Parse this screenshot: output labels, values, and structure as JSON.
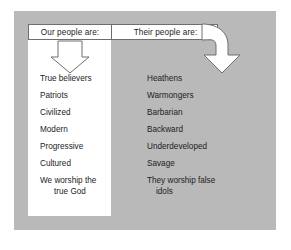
{
  "figure": {
    "panel_color": "#b9b9b9",
    "box_color": "#ffffff",
    "line_color": "#6e6e6e",
    "text_color": "#1c1c1c"
  },
  "headers": {
    "left": "Our people are:",
    "right": "Their people are:"
  },
  "columns": {
    "left": {
      "items": [
        {
          "text": "True believers"
        },
        {
          "text": "Patriots"
        },
        {
          "text": "Civilized"
        },
        {
          "text": "Modern"
        },
        {
          "text": "Progressive"
        },
        {
          "text": "Cultured"
        },
        {
          "line1": "We worship the",
          "line2": "true God"
        }
      ]
    },
    "right": {
      "items": [
        {
          "text": "Heathens"
        },
        {
          "text": "Warmongers"
        },
        {
          "text": "Barbarian"
        },
        {
          "text": "Backward"
        },
        {
          "text": "Underdeveloped"
        },
        {
          "text": "Savage"
        },
        {
          "line1": "They worship false",
          "line2": "idols"
        }
      ]
    }
  },
  "arrows": {
    "left": "down-arrow-icon",
    "right": "curved-down-arrow-icon"
  }
}
